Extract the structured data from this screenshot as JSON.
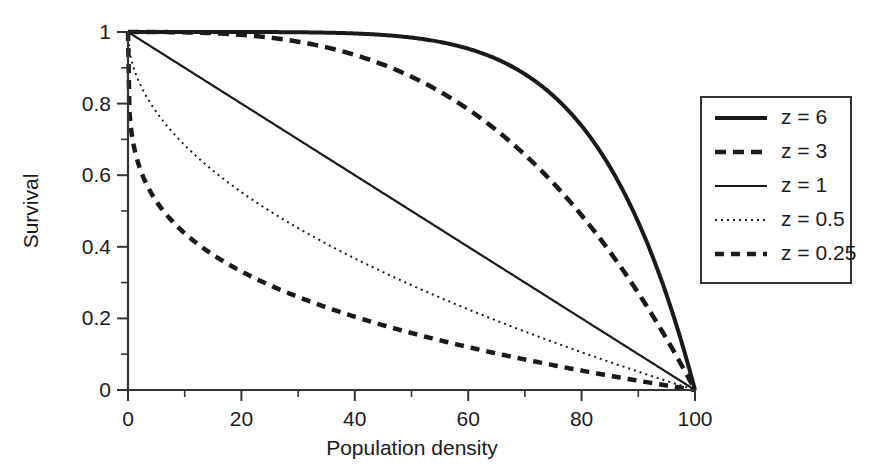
{
  "chart_data": {
    "type": "line",
    "title": "",
    "xlabel": "Population density",
    "ylabel": "Survival",
    "xlim": [
      0,
      100
    ],
    "ylim": [
      0,
      1
    ],
    "grid": false,
    "legend_position": "right",
    "formula": "Survival = 1 - (Population density / 100)^z",
    "x_ticks_major": [
      "0",
      "20",
      "40",
      "60",
      "80",
      "100"
    ],
    "x_ticks_major_values": [
      0,
      20,
      40,
      60,
      80,
      100
    ],
    "x_ticks_minor_values": [
      10,
      30,
      50,
      70,
      90
    ],
    "y_ticks_major": [
      "0",
      "0.2",
      "0.4",
      "0.6",
      "0.8",
      "1"
    ],
    "y_ticks_major_values": [
      0,
      0.2,
      0.4,
      0.6,
      0.8,
      1
    ],
    "y_ticks_minor_values": [
      0.1,
      0.3,
      0.5,
      0.7,
      0.9
    ],
    "x": [
      0,
      5,
      10,
      15,
      20,
      25,
      30,
      35,
      40,
      45,
      50,
      55,
      60,
      65,
      70,
      75,
      80,
      85,
      90,
      95,
      100
    ],
    "series": [
      {
        "name": "z = 6",
        "z": 6,
        "style": "solid-thick",
        "stroke_width": 4.0,
        "dash": "none",
        "color": "#1a1a1a",
        "values": [
          1,
          1,
          1,
          0.999,
          0.999,
          0.996,
          0.999,
          0.998,
          0.996,
          0.992,
          0.984,
          0.972,
          0.953,
          0.925,
          0.882,
          0.822,
          0.738,
          0.623,
          0.469,
          0.265,
          0
        ]
      },
      {
        "name": "z = 3",
        "z": 3,
        "style": "dashed-thick",
        "stroke_width": 4.5,
        "dash": "11,7",
        "color": "#1a1a1a",
        "values": [
          1,
          1.0,
          0.999,
          0.997,
          0.992,
          0.984,
          0.973,
          0.957,
          0.936,
          0.909,
          0.875,
          0.834,
          0.784,
          0.725,
          0.657,
          0.578,
          0.488,
          0.386,
          0.271,
          0.143,
          0
        ]
      },
      {
        "name": "z = 1",
        "z": 1,
        "style": "solid-thin",
        "stroke_width": 2.2,
        "dash": "none",
        "color": "#1a1a1a",
        "values": [
          1,
          0.95,
          0.9,
          0.85,
          0.8,
          0.75,
          0.7,
          0.65,
          0.6,
          0.55,
          0.5,
          0.45,
          0.4,
          0.35,
          0.3,
          0.25,
          0.2,
          0.15,
          0.1,
          0.05,
          0
        ]
      },
      {
        "name": "z = 0.5",
        "z": 0.5,
        "style": "dotted-thin",
        "stroke_width": 2.0,
        "dash": "2,4",
        "color": "#1a1a1a",
        "values": [
          1,
          0.776,
          0.684,
          0.613,
          0.553,
          0.5,
          0.452,
          0.408,
          0.368,
          0.329,
          0.293,
          0.258,
          0.225,
          0.194,
          0.163,
          0.134,
          0.106,
          0.078,
          0.051,
          0.025,
          0
        ]
      },
      {
        "name": "z = 0.25",
        "z": 0.25,
        "style": "dashed-medium",
        "stroke_width": 4.5,
        "dash": "9,7",
        "color": "#1a1a1a",
        "values": [
          1,
          0.527,
          0.438,
          0.378,
          0.331,
          0.293,
          0.26,
          0.232,
          0.205,
          0.181,
          0.159,
          0.139,
          0.12,
          0.102,
          0.085,
          0.068,
          0.054,
          0.039,
          0.026,
          0.013,
          0
        ]
      }
    ]
  },
  "legend": {
    "items": [
      {
        "label": "z = 6"
      },
      {
        "label": "z = 3"
      },
      {
        "label": "z = 1"
      },
      {
        "label": "z = 0.5"
      },
      {
        "label": "z = 0.25"
      }
    ]
  },
  "colors": {
    "ink": "#1a1a1a",
    "axis": "#333333",
    "background": "#ffffff"
  }
}
